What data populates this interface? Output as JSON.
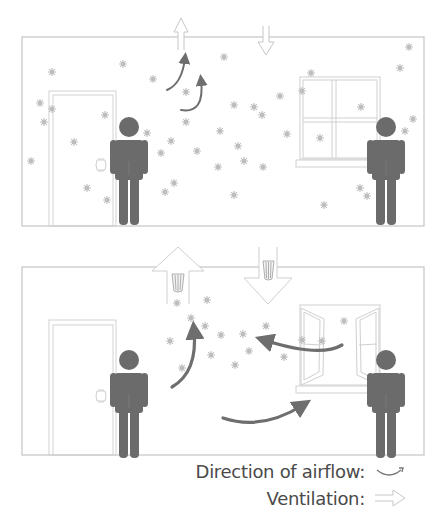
{
  "colors": {
    "wall": "#c9c9c9",
    "frame": "#d2d2d2",
    "person": "#6b6b6b",
    "arrow": "#6e6e6e",
    "particle": "#bcbcbc",
    "vent": "#cfcfcf",
    "text": "#4a4a4a"
  },
  "scenes": [
    {
      "name": "without-ventilation",
      "room": {
        "x": 22,
        "y": 37,
        "w": 402,
        "h": 189
      },
      "door": {
        "x": 49,
        "y": 91,
        "w": 67,
        "h": 135
      },
      "window": {
        "x": 298,
        "y": 77,
        "w": 82,
        "h": 90,
        "type": "closed"
      },
      "people": [
        {
          "x": 129,
          "y": 127
        },
        {
          "x": 386,
          "y": 127
        }
      ],
      "vents": [
        {
          "x": 181,
          "dir": "up",
          "size": "small"
        },
        {
          "x": 266,
          "dir": "down",
          "size": "small"
        }
      ],
      "airflow_arrows": [
        {
          "d": "M167,90 Q182,84 185,58"
        },
        {
          "d": "M181,110 Q205,114 201,80"
        }
      ],
      "particles": [
        [
          52,
          72
        ],
        [
          123,
          64
        ],
        [
          153,
          79
        ],
        [
          224,
          57
        ],
        [
          40,
          103
        ],
        [
          52,
          109
        ],
        [
          44,
          122
        ],
        [
          74,
          142
        ],
        [
          105,
          115
        ],
        [
          31,
          161
        ],
        [
          147,
          133
        ],
        [
          186,
          92
        ],
        [
          186,
          122
        ],
        [
          234,
          105
        ],
        [
          254,
          107
        ],
        [
          262,
          115
        ],
        [
          280,
          96
        ],
        [
          302,
          91
        ],
        [
          311,
          73
        ],
        [
          220,
          131
        ],
        [
          171,
          141
        ],
        [
          161,
          153
        ],
        [
          197,
          151
        ],
        [
          238,
          146
        ],
        [
          244,
          161
        ],
        [
          218,
          167
        ],
        [
          263,
          167
        ],
        [
          287,
          134
        ],
        [
          320,
          138
        ],
        [
          361,
          107
        ],
        [
          87,
          188
        ],
        [
          107,
          200
        ],
        [
          174,
          183
        ],
        [
          165,
          192
        ],
        [
          234,
          195
        ],
        [
          324,
          205
        ],
        [
          360,
          188
        ],
        [
          367,
          196
        ],
        [
          409,
          47
        ],
        [
          400,
          68
        ],
        [
          413,
          119
        ],
        [
          405,
          131
        ]
      ]
    },
    {
      "name": "with-ventilation",
      "room": {
        "x": 22,
        "y": 267,
        "w": 402,
        "h": 188
      },
      "door": {
        "x": 49,
        "y": 320,
        "w": 67,
        "h": 135
      },
      "window": {
        "x": 299,
        "y": 304,
        "w": 82,
        "h": 85,
        "type": "open"
      },
      "people": [
        {
          "x": 129,
          "y": 362
        },
        {
          "x": 386,
          "y": 362
        }
      ],
      "vents": [
        {
          "x": 178,
          "dir": "up",
          "size": "large"
        },
        {
          "x": 268,
          "dir": "down",
          "size": "large"
        }
      ],
      "airflow_arrows": [
        {
          "d": "M172,387 Q198,372 194,330"
        },
        {
          "d": "M342,345 Q320,358 264,340"
        },
        {
          "d": "M223,418 Q262,431 303,405"
        }
      ],
      "particles": [
        [
          177,
          303
        ],
        [
          207,
          300
        ],
        [
          191,
          318
        ],
        [
          205,
          326
        ],
        [
          221,
          335
        ],
        [
          243,
          334
        ],
        [
          170,
          341
        ],
        [
          211,
          355
        ],
        [
          182,
          368
        ],
        [
          235,
          365
        ],
        [
          249,
          351
        ],
        [
          266,
          326
        ],
        [
          284,
          357
        ],
        [
          302,
          340
        ],
        [
          322,
          341
        ],
        [
          344,
          321
        ]
      ]
    }
  ],
  "legend": {
    "items": [
      {
        "label": "Direction of airflow:",
        "icon": "curved-arrow-icon"
      },
      {
        "label": "Ventilation:",
        "icon": "hollow-arrow-icon"
      }
    ]
  }
}
